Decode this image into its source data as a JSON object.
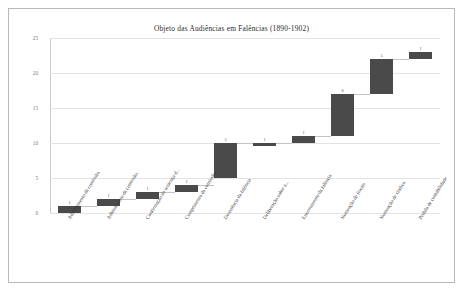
{
  "chart_data": {
    "type": "bar",
    "subtype": "waterfall",
    "title": "Objeto das Audiências em Falências (1890-1902)",
    "xlabel": "",
    "ylabel": "",
    "ylim": [
      0,
      25
    ],
    "yticks": [
      0,
      5,
      10,
      15,
      20,
      25
    ],
    "grid": true,
    "legend": false,
    "categories": [
      "Adiantamento da comissão.",
      "Arbitramento da comissão.",
      "Confirmação da sentença d...",
      "Cumprimento da comissão.",
      "Desistência da falência",
      "Deliberação sobre a...",
      "Encerramento da falência",
      "Nomeação de fiscais",
      "Nomeação de síndico",
      "Pedido de contabilidade"
    ],
    "values": [
      1,
      1,
      1,
      1,
      5,
      1,
      1,
      6,
      5,
      1
    ],
    "cumulative_start": [
      0,
      1,
      2,
      3,
      5,
      10,
      10,
      11,
      17,
      22
    ],
    "cumulative_end": [
      1,
      2,
      3,
      4,
      10,
      10,
      11,
      17,
      22,
      23
    ],
    "point_labels": [
      "1",
      "1",
      "1",
      "1",
      "5",
      "1",
      "1",
      "6",
      "5",
      "1"
    ],
    "bar_color": "#4a4a4a",
    "grid_color": "#e3e3e3",
    "connector_color": "#c4c4c4"
  }
}
